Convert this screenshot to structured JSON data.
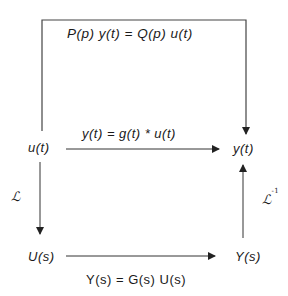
{
  "diagram": {
    "top_equation": "P(p) y(t) = Q(p) u(t)",
    "middle_equation": "y(t) = g(t) * u(t)",
    "bottom_equation": "Y(s) = G(s) U(s)",
    "nodes": {
      "u_t": "u(t)",
      "y_t": "y(t)",
      "U_s": "U(s)",
      "Y_s": "Y(s)"
    },
    "transforms": {
      "forward": "ℒ",
      "inverse": "ℒ",
      "inverse_superscript": "-1"
    },
    "colors": {
      "line": "#333333",
      "text": "#1a1a1a",
      "background": "#ffffff"
    }
  }
}
